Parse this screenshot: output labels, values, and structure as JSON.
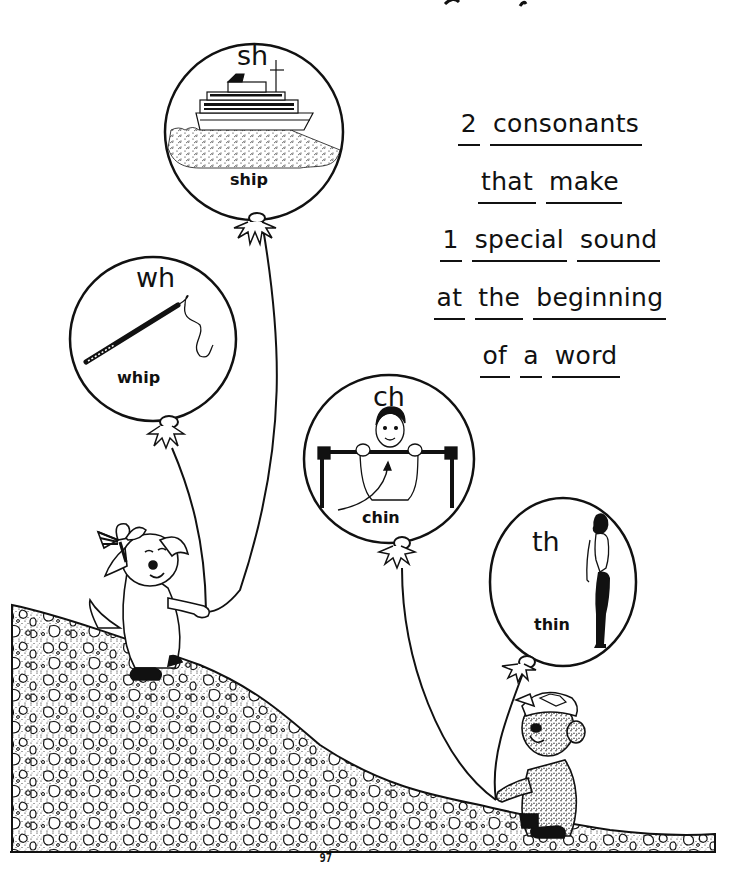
{
  "page": {
    "number": "97",
    "colors": {
      "ink": "#111111",
      "paper": "#ffffff"
    }
  },
  "rule": {
    "lines": [
      [
        "2",
        "consonants"
      ],
      [
        "that",
        "make"
      ],
      [
        "1",
        "special",
        "sound"
      ],
      [
        "at",
        "the",
        "beginning"
      ],
      [
        "of",
        "a",
        "word"
      ]
    ]
  },
  "balloons": [
    {
      "digraph": "sh",
      "word": "ship",
      "picture": "ship-icon"
    },
    {
      "digraph": "wh",
      "word": "whip",
      "picture": "whip-icon"
    },
    {
      "digraph": "ch",
      "word": "chin",
      "picture": "chin-up-icon"
    },
    {
      "digraph": "th",
      "word": "thin",
      "picture": "thin-woman-icon"
    }
  ],
  "characters": [
    {
      "name": "dog with bow",
      "holds": [
        "sh",
        "wh"
      ]
    },
    {
      "name": "bear with cap",
      "holds": [
        "ch",
        "th"
      ]
    }
  ]
}
